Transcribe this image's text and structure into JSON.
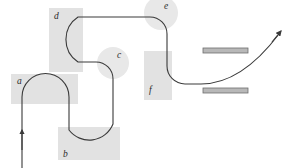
{
  "figure": {
    "title": "",
    "width": 289,
    "height": 168,
    "background_color": "#ffffff"
  },
  "colors": {
    "region_fill": "#e2e2e2",
    "region_fill_circle": "#e8e8e8",
    "trajectory_stroke": "#3a3a3a",
    "plate_fill": "#b8b8b8",
    "plate_stroke": "#6e6e6e",
    "label_color": "#2a2a2a"
  },
  "regions": [
    {
      "id": "region-a",
      "label": "a",
      "shape": "rect",
      "x": 11,
      "y": 74,
      "width": 67,
      "height": 30,
      "label_x": 17,
      "label_y": 84
    },
    {
      "id": "region-b",
      "label": "b",
      "shape": "rect",
      "x": 58,
      "y": 127,
      "width": 62,
      "height": 33,
      "label_x": 63,
      "label_y": 157
    },
    {
      "id": "region-d",
      "label": "d",
      "shape": "rect",
      "x": 49,
      "y": 8,
      "width": 34,
      "height": 64,
      "label_x": 54,
      "label_y": 19
    },
    {
      "id": "region-f",
      "label": "f",
      "shape": "rect",
      "x": 144,
      "y": 51,
      "width": 28,
      "height": 49,
      "label_x": 149,
      "label_y": 93
    },
    {
      "id": "region-c",
      "label": "c",
      "shape": "circle",
      "cx": 113,
      "cy": 63,
      "r": 16,
      "label_x": 117,
      "label_y": 58
    },
    {
      "id": "region-e",
      "label": "e",
      "shape": "circle",
      "cx": 161,
      "cy": 13,
      "r": 17,
      "label_x": 164,
      "label_y": 9
    }
  ],
  "plates": [
    {
      "id": "plate-top",
      "label": "",
      "x": 203,
      "y": 48,
      "width": 45,
      "height": 5
    },
    {
      "id": "plate-bottom",
      "label": "",
      "x": 203,
      "y": 88,
      "width": 45,
      "height": 5
    }
  ],
  "trajectory": {
    "stroke_width": 1.1,
    "path": "M 22,168 L 22,104 L 22,97 A 23.5,23.5 0 0 1 69,97 L 69,130 A 25,25 0 0 1 96,144 A 25,25 0 0 1 113,120 L 113,79 A 17,17 0 0 1 96,62 L 78,62 A 27,27 0 0 1 78,17 L 150,17 A 17,17 0 0 1 167,34 L 167,66 A 18,18 0 0 0 185,84 L 201,84 C 228,84 253,68 279,35"
  },
  "entry_arrow": {
    "id": "entry-arrow",
    "direction": "up",
    "tip_x": 22,
    "tip_y": 131,
    "tail_x": 22,
    "tail_y": 168
  },
  "exit_arrow": {
    "id": "exit-arrow",
    "direction": "up-right",
    "tip_x": 283,
    "tip_y": 30
  }
}
